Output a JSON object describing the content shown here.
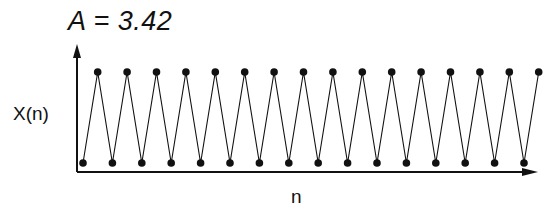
{
  "title": "A = 3.42",
  "axes": {
    "ylabel": "X(n)",
    "xlabel": "n"
  },
  "chart_data": {
    "type": "line",
    "title": "A = 3.42",
    "xlabel": "n",
    "ylabel": "X(n)",
    "x": [
      0,
      1,
      2,
      3,
      4,
      5,
      6,
      7,
      8,
      9,
      10,
      11,
      12,
      13,
      14,
      15,
      16,
      17,
      18,
      19,
      20,
      21,
      22,
      23,
      24,
      25,
      26,
      27,
      28,
      29,
      30,
      31
    ],
    "levels": {
      "low": 0,
      "high": 1
    },
    "values": [
      0,
      1,
      0,
      1,
      0,
      1,
      0,
      1,
      0,
      1,
      0,
      1,
      0,
      1,
      0,
      1,
      0,
      1,
      0,
      1,
      0,
      1,
      0,
      1,
      0,
      1,
      0,
      1,
      0,
      1,
      0,
      1
    ],
    "markers": "filled-circle",
    "grid": false,
    "legend": null
  },
  "layout": {
    "x_start_px": 83,
    "x_step_px": 14.7,
    "y_low_px": 163,
    "y_high_px": 72,
    "axis_origin": [
      77,
      172
    ],
    "y_axis_top": 44,
    "x_axis_right": 538,
    "color": "#111111"
  }
}
